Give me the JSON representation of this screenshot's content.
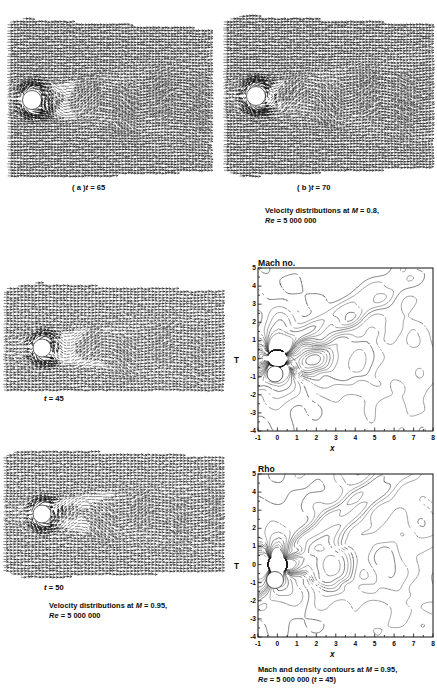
{
  "figure": {
    "type": "scientific-figure",
    "background": "#ffffff",
    "ink": "#111111"
  },
  "panels": {
    "top_left": {
      "label_prefix": "( a )",
      "label_var": "t",
      "label_value": "= 65",
      "label_full": "( a ) t = 65",
      "kind": "velocity-vector-field"
    },
    "top_right": {
      "label_prefix": "( b )",
      "label_var": "t",
      "label_value": "= 70",
      "label_full": "( b ) t = 70",
      "kind": "velocity-vector-field"
    },
    "mid_left": {
      "label_var": "t",
      "label_value": "= 45",
      "label_full": "t = 45",
      "kind": "velocity-vector-field"
    },
    "bot_left": {
      "label_var": "t",
      "label_value": "= 50",
      "label_full": "t = 50",
      "kind": "velocity-vector-field"
    },
    "mid_right": {
      "title": "Mach no.",
      "kind": "contour-plot"
    },
    "bot_right": {
      "title": "Rho",
      "kind": "contour-plot"
    }
  },
  "captions": {
    "top": {
      "line1_pre": "Velocity distributions at ",
      "line1_sym": "M",
      "line1_post": " = 0.8,",
      "line2_sym": "Re",
      "line2_post": " = 5 000 000"
    },
    "mid_left": {
      "line1_pre": "Velocity distributions at ",
      "line1_sym": "M",
      "line1_post": " = 0.95,",
      "line2_sym": "Re",
      "line2_post": " = 5 000 000"
    },
    "bottom": {
      "line1_pre": "Mach and density contours at ",
      "line1_sym": "M",
      "line1_post": " = 0.95,",
      "line2_sym": "Re",
      "line2_post": " = 5 000 000 (",
      "line2_var": "t",
      "line2_tail": " = 45)"
    }
  },
  "chart_data": [
    {
      "id": "mach-contours",
      "type": "contour",
      "title": "Mach no.",
      "xlabel": "x",
      "ylabel": "T",
      "xlim": [
        -1,
        8
      ],
      "ylim": [
        -4,
        5
      ],
      "xticks": [
        "-1",
        "0",
        "1",
        "2",
        "3",
        "4",
        "5",
        "6",
        "7",
        "8"
      ],
      "yticks": [
        "5",
        "4",
        "3",
        "2",
        "1",
        "0",
        "-1",
        "-2",
        "-3",
        "-4"
      ],
      "xtick_values": [
        -1,
        0,
        1,
        2,
        3,
        4,
        5,
        6,
        7,
        8
      ],
      "ytick_values": [
        5,
        4,
        3,
        2,
        1,
        0,
        -1,
        -2,
        -3,
        -4
      ],
      "grid": false,
      "legend": "none",
      "body": {
        "shape": "circular cylinder",
        "center": [
          0,
          0
        ],
        "radius": 0.5
      },
      "annotations": []
    },
    {
      "id": "rho-contours",
      "type": "contour",
      "title": "Rho",
      "xlabel": "x",
      "ylabel": "T",
      "xlim": [
        -1,
        8
      ],
      "ylim": [
        -4,
        5
      ],
      "xticks": [
        "-1",
        "0",
        "1",
        "2",
        "3",
        "4",
        "5",
        "6",
        "7",
        "8"
      ],
      "yticks": [
        "5",
        "4",
        "3",
        "2",
        "1",
        "0",
        "-1",
        "-2",
        "-3",
        "-4"
      ],
      "xtick_values": [
        -1,
        0,
        1,
        2,
        3,
        4,
        5,
        6,
        7,
        8
      ],
      "ytick_values": [
        5,
        4,
        3,
        2,
        1,
        0,
        -1,
        -2,
        -3,
        -4
      ],
      "grid": false,
      "legend": "none",
      "body": {
        "shape": "circular cylinder",
        "center": [
          0,
          0
        ],
        "radius": 0.5
      },
      "annotations": []
    },
    {
      "id": "velocity-field-a-t65",
      "type": "vector-field",
      "title": "( a ) t = 65",
      "mach": 0.8,
      "reynolds": 5000000,
      "time": 65,
      "body": {
        "shape": "circular cylinder"
      }
    },
    {
      "id": "velocity-field-b-t70",
      "type": "vector-field",
      "title": "( b ) t = 70",
      "mach": 0.8,
      "reynolds": 5000000,
      "time": 70,
      "body": {
        "shape": "circular cylinder"
      }
    },
    {
      "id": "velocity-field-t45",
      "type": "vector-field",
      "title": "t = 45",
      "mach": 0.95,
      "reynolds": 5000000,
      "time": 45,
      "body": {
        "shape": "circular cylinder"
      }
    },
    {
      "id": "velocity-field-t50",
      "type": "vector-field",
      "title": "t = 50",
      "mach": 0.95,
      "reynolds": 5000000,
      "time": 50,
      "body": {
        "shape": "circular cylinder"
      }
    }
  ]
}
